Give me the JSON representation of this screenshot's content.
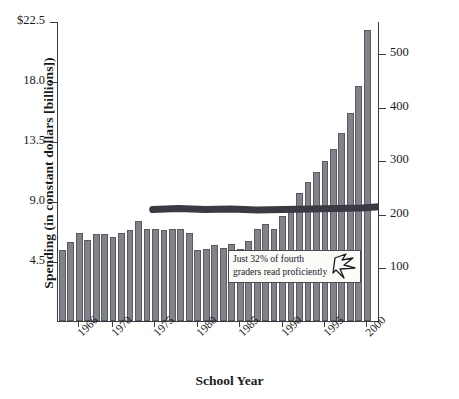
{
  "chart_data": {
    "type": "bar",
    "title": "",
    "xlabel": "School Year",
    "ylabel": "Spending (in constant dollars [billions])",
    "y2label": "Reading Scores",
    "grid": false,
    "legend": "none",
    "ylim": [
      0,
      22.5
    ],
    "y2lim": [
      0,
      560
    ],
    "yticks": [
      "$22.5",
      "18.0",
      "13.5",
      "9.0",
      "4.5"
    ],
    "ytick_values": [
      22.5,
      18.0,
      13.5,
      9.0,
      4.5
    ],
    "y2ticks": [
      "500",
      "400",
      "300",
      "200",
      "100"
    ],
    "y2tick_values": [
      500,
      400,
      300,
      200,
      100
    ],
    "xticks": [
      "1966",
      "1970",
      "1975",
      "1980",
      "1985",
      "1990",
      "1995",
      "2000"
    ],
    "xtick_values": [
      1966,
      1970,
      1975,
      1980,
      1985,
      1990,
      1995,
      2000
    ],
    "categories": [
      1964,
      1965,
      1966,
      1967,
      1968,
      1969,
      1970,
      1971,
      1972,
      1973,
      1974,
      1975,
      1976,
      1977,
      1978,
      1979,
      1980,
      1981,
      1982,
      1983,
      1984,
      1985,
      1986,
      1987,
      1988,
      1989,
      1990,
      1991,
      1992,
      1993,
      1994,
      1995,
      1996,
      1997,
      1998,
      1999,
      2000,
      2001
    ],
    "series": [
      {
        "name": "Spending (in constant dollars [billions])",
        "axis": "left",
        "type": "bar",
        "color": "#82828a",
        "values": [
          5.3,
          5.9,
          6.6,
          6.1,
          6.5,
          6.5,
          6.3,
          6.6,
          6.8,
          7.5,
          6.9,
          6.9,
          6.8,
          6.9,
          6.9,
          6.6,
          5.3,
          5.4,
          5.7,
          5.5,
          5.8,
          5.4,
          6.0,
          6.9,
          7.3,
          6.9,
          7.9,
          8.6,
          9.6,
          10.4,
          11.2,
          12.0,
          12.9,
          14.1,
          15.6,
          17.6,
          21.8,
          0
        ]
      },
      {
        "name": "Reading Scores",
        "axis": "right",
        "type": "line",
        "color": "#3a3a42",
        "x": [
          1975,
          1978,
          1981,
          1984,
          1987,
          1990,
          1993,
          1996,
          1999,
          2001
        ],
        "values": [
          210,
          212,
          210,
          211,
          209,
          210,
          211,
          212,
          213,
          215
        ]
      }
    ],
    "annotations": [
      {
        "name": "proficiency-callout",
        "text": "Just 32% of fourth graders read proficiently",
        "line1": "Just 32% of fourth",
        "line2": "graders read proficiently",
        "icon": "cursor-arrow-icon"
      }
    ],
    "colors": {
      "bar_fill": "#82828a",
      "bar_stroke": "#5a5a62",
      "line": "#3a3a42",
      "axis": "#3a3a42",
      "background": "#ffffff",
      "callout_bg": "#fbfbf8",
      "text": "#1a1a1a"
    }
  },
  "axes": {
    "left_title": "Spending (in constant dollars [billions])",
    "right_title": "Reading Scores",
    "bottom_title": "School Year"
  }
}
